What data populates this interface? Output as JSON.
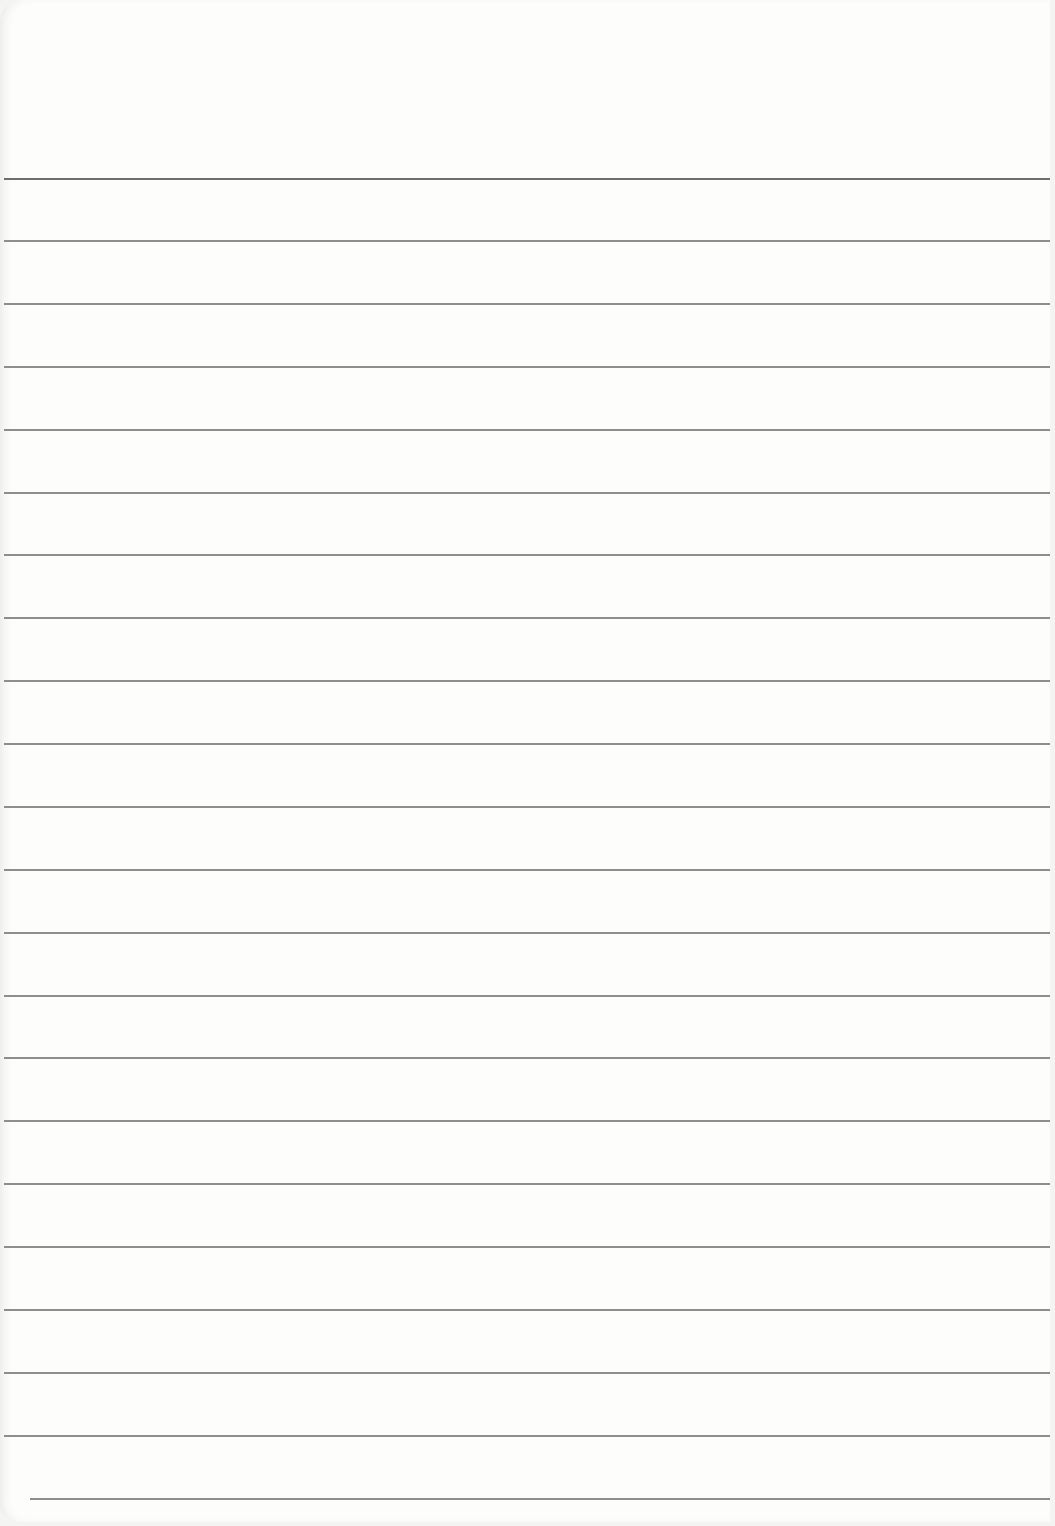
{
  "page": {
    "type": "blank ruled notebook paper",
    "line_color": "#7a7a7a",
    "paper_color": "#fdfdfc",
    "rules": [
      {
        "y": 179,
        "x1": 4,
        "x2": 1050
      },
      {
        "y": 241,
        "x1": 4,
        "x2": 1050
      },
      {
        "y": 304,
        "x1": 4,
        "x2": 1050
      },
      {
        "y": 367,
        "x1": 4,
        "x2": 1050
      },
      {
        "y": 430,
        "x1": 4,
        "x2": 1050
      },
      {
        "y": 493,
        "x1": 4,
        "x2": 1050
      },
      {
        "y": 555,
        "x1": 4,
        "x2": 1050
      },
      {
        "y": 618,
        "x1": 4,
        "x2": 1050
      },
      {
        "y": 681,
        "x1": 4,
        "x2": 1050
      },
      {
        "y": 744,
        "x1": 4,
        "x2": 1050
      },
      {
        "y": 807,
        "x1": 4,
        "x2": 1050
      },
      {
        "y": 870,
        "x1": 4,
        "x2": 1050
      },
      {
        "y": 933,
        "x1": 4,
        "x2": 1050
      },
      {
        "y": 996,
        "x1": 4,
        "x2": 1050
      },
      {
        "y": 1058,
        "x1": 4,
        "x2": 1050
      },
      {
        "y": 1121,
        "x1": 4,
        "x2": 1050
      },
      {
        "y": 1184,
        "x1": 4,
        "x2": 1050
      },
      {
        "y": 1247,
        "x1": 4,
        "x2": 1050
      },
      {
        "y": 1310,
        "x1": 4,
        "x2": 1050
      },
      {
        "y": 1373,
        "x1": 4,
        "x2": 1050
      },
      {
        "y": 1436,
        "x1": 4,
        "x2": 1050
      },
      {
        "y": 1499,
        "x1": 30,
        "x2": 1050
      }
    ]
  }
}
